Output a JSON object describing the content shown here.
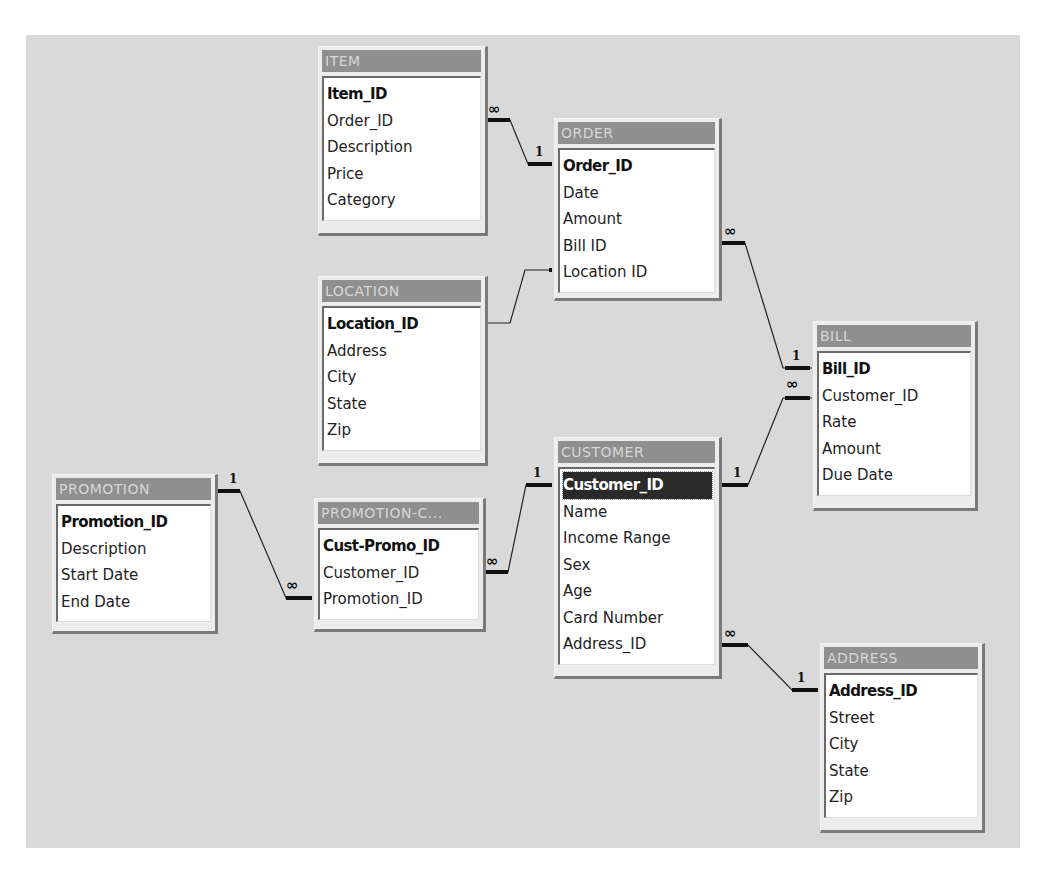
{
  "diagram": {
    "type": "relationships",
    "tables": [
      {
        "id": "item",
        "title": "ITEM",
        "fields": [
          "Item_ID",
          "Order_ID",
          "Description",
          "Price",
          "Category"
        ],
        "primary_key": "Item_ID"
      },
      {
        "id": "order",
        "title": "ORDER",
        "fields": [
          "Order_ID",
          "Date",
          "Amount",
          "Bill ID",
          "Location ID"
        ],
        "primary_key": "Order_ID"
      },
      {
        "id": "location",
        "title": "LOCATION",
        "fields": [
          "Location_ID",
          "Address",
          "City",
          "State",
          "Zip"
        ],
        "primary_key": "Location_ID"
      },
      {
        "id": "bill",
        "title": "BILL",
        "fields": [
          "Bill_ID",
          "Customer_ID",
          "Rate",
          "Amount",
          "Due Date"
        ],
        "primary_key": "Bill_ID"
      },
      {
        "id": "customer",
        "title": "CUSTOMER",
        "fields": [
          "Customer_ID",
          "Name",
          "Income Range",
          "Sex",
          "Age",
          "Card Number",
          "Address_ID"
        ],
        "primary_key": "Customer_ID",
        "selected_field": "Customer_ID"
      },
      {
        "id": "promotion",
        "title": "PROMOTION",
        "fields": [
          "Promotion_ID",
          "Description",
          "Start Date",
          "End Date"
        ],
        "primary_key": "Promotion_ID"
      },
      {
        "id": "promotion_customer",
        "title": "PROMOTION-C...",
        "fields": [
          "Cust-Promo_ID",
          "Customer_ID",
          "Promotion_ID"
        ],
        "primary_key": "Cust-Promo_ID"
      },
      {
        "id": "address",
        "title": "ADDRESS",
        "fields": [
          "Address_ID",
          "Street",
          "City",
          "State",
          "Zip"
        ],
        "primary_key": "Address_ID"
      }
    ],
    "relationships": [
      {
        "from": "ITEM",
        "from_side": "∞",
        "to": "ORDER",
        "to_side": "1"
      },
      {
        "from": "LOCATION",
        "from_side": "",
        "to": "ORDER",
        "to_side": ""
      },
      {
        "from": "ORDER",
        "from_side": "∞",
        "to": "BILL",
        "to_side": "1"
      },
      {
        "from": "CUSTOMER",
        "from_side": "1",
        "to": "BILL",
        "to_side": "∞"
      },
      {
        "from": "PROMOTION",
        "from_side": "1",
        "to": "PROMOTION-C...",
        "to_side": "∞"
      },
      {
        "from": "PROMOTION-C...",
        "from_side": "∞",
        "to": "CUSTOMER",
        "to_side": "1"
      },
      {
        "from": "CUSTOMER",
        "from_side": "∞",
        "to": "ADDRESS",
        "to_side": "1"
      }
    ],
    "cardinality_symbols": {
      "one": "1",
      "many": "∞"
    }
  }
}
